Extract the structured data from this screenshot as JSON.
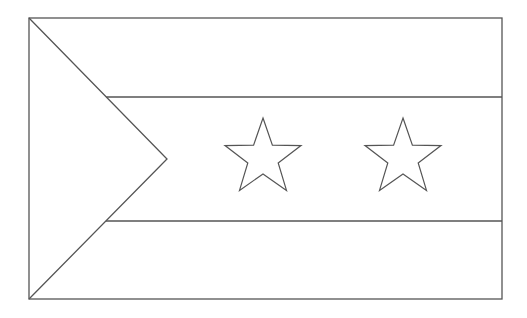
{
  "figure": {
    "stroke_color": "#555555",
    "background": "#ffffff"
  },
  "flag": {
    "frame": {
      "x": 29,
      "y": 18,
      "width": 473,
      "height": 281
    },
    "stripes": {
      "upper_line_y": 97,
      "lower_line_y": 221
    },
    "triangle": {
      "tip": [
        167,
        159
      ]
    },
    "stars": [
      {
        "cx": 263,
        "cy": 158,
        "r_outer": 40,
        "r_inner": 16
      },
      {
        "cx": 403,
        "cy": 158,
        "r_outer": 40,
        "r_inner": 16
      }
    ]
  }
}
